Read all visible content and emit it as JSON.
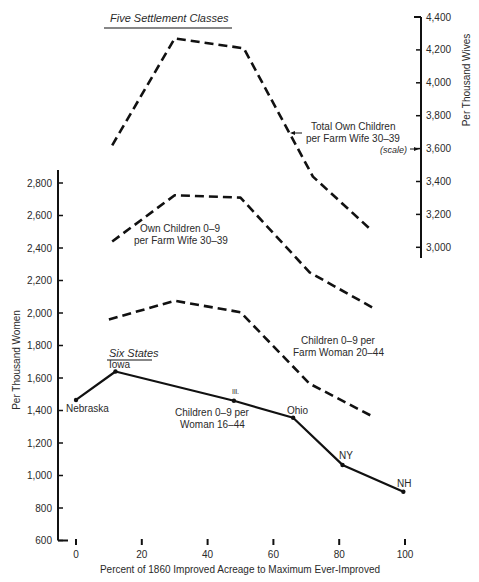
{
  "chart_data": {
    "type": "line",
    "title": "",
    "xlabel": "Percent of 1860 Improved Acreage to Maximum Ever-Improved",
    "ylabel": "Per Thousand Women",
    "y2label": "Per Thousand Wives",
    "xlim": [
      0,
      100
    ],
    "ylim": [
      600,
      2800
    ],
    "y2lim": [
      3000,
      4400
    ],
    "x_ticks": [
      0,
      20,
      40,
      60,
      80,
      100
    ],
    "y_ticks": [
      600,
      800,
      1000,
      1200,
      1400,
      1600,
      1800,
      2000,
      2200,
      2400,
      2600,
      2800
    ],
    "y2_ticks": [
      3000,
      3200,
      3400,
      3600,
      3800,
      4000,
      4200,
      4400
    ],
    "x_tick_labels": [
      "0",
      "20",
      "40",
      "60",
      "80",
      "100"
    ],
    "y_tick_labels": [
      "600",
      "800",
      "1,000",
      "1,200",
      "1,400",
      "1,600",
      "1,800",
      "2,000",
      "2,200",
      "2,400",
      "2,600",
      "2,800"
    ],
    "y2_tick_labels": [
      "3,000",
      "3,200",
      "3,400",
      "3,600",
      "3,800",
      "4,000",
      "4,200",
      "4,400"
    ],
    "grid": false,
    "groups": [
      {
        "heading": "Five Settlement Classes"
      },
      {
        "heading": "Six States"
      }
    ],
    "series": [
      {
        "name": "Total Own Children per Farm Wife 30-39",
        "group": "Five Settlement Classes",
        "axis": "right",
        "style": "dashed",
        "x": [
          11,
          30,
          51,
          72,
          90
        ],
        "values": [
          3620,
          4270,
          4210,
          3430,
          3100
        ]
      },
      {
        "name": "Own Children 0-9 per Farm Wife 30-39",
        "group": "Five Settlement Classes",
        "axis": "left",
        "style": "dashed",
        "x": [
          11,
          30,
          50,
          71,
          90
        ],
        "values": [
          2440,
          2725,
          2710,
          2250,
          2035
        ]
      },
      {
        "name": "Children 0-9 per Farm Woman 20-44",
        "group": "Five Settlement Classes",
        "axis": "left",
        "style": "dashed",
        "x": [
          10,
          30,
          50,
          71,
          90
        ],
        "values": [
          1960,
          2075,
          2005,
          1565,
          1365
        ]
      },
      {
        "name": "Children 0-9 per Woman 16-44",
        "group": "Six States",
        "axis": "left",
        "style": "solid",
        "x": [
          0,
          12,
          48,
          66,
          81,
          99.5
        ],
        "values": [
          1465,
          1640,
          1460,
          1355,
          1065,
          900
        ],
        "point_labels": [
          "Nebraska",
          "Iowa",
          "Ill.",
          "Ohio",
          "NY",
          "NH"
        ]
      }
    ],
    "annotations": [
      {
        "text": "Total Own Children",
        "line2": "per Farm Wife 30-39",
        "note": "(scale)"
      },
      {
        "text": "Own Children 0-9",
        "line2": "per Farm Wife 30-39"
      },
      {
        "text": "Children 0-9 per",
        "line2": "Farm Woman 20-44"
      },
      {
        "text": "Children 0-9 per",
        "line2": "Woman 16-44"
      }
    ]
  },
  "labels": {
    "heading_five": "Five Settlement Classes",
    "heading_six": "Six States",
    "xlabel": "Percent of 1860 Improved Acreage to Maximum Ever-Improved",
    "ylabel": "Per Thousand Women",
    "y2label": "Per Thousand Wives",
    "ann_total_1": "Total Own Children",
    "ann_total_2": "per Farm Wife 30–39",
    "ann_scale": "(scale)",
    "ann_own_1": "Own Children 0–9",
    "ann_own_2": "per Farm Wife 30–39",
    "ann_farmwoman_1": "Children 0–9 per",
    "ann_farmwoman_2": "Farm Woman 20–44",
    "ann_woman_1": "Children 0–9 per",
    "ann_woman_2": "Woman 16–44",
    "state_nebraska": "Nebraska",
    "state_iowa": "Iowa",
    "state_ill": "Ill.",
    "state_ohio": "Ohio",
    "state_ny": "NY",
    "state_nh": "NH"
  },
  "colors": {
    "ink": "#111111",
    "text": "#2a2a2a",
    "background": "#ffffff"
  }
}
